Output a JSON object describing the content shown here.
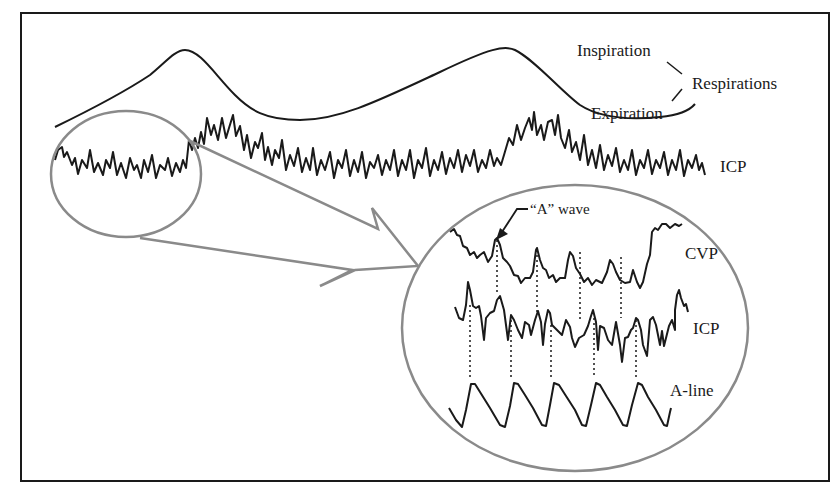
{
  "figure": {
    "header_cut_text": "",
    "colors": {
      "trace": "#1a1a1a",
      "magnifier": "#8a8a8a",
      "frame": "#1a1a1a",
      "background": "#ffffff"
    }
  },
  "labels": {
    "inspiration": "Inspiration",
    "expiration": "Expiration",
    "respirations": "Respirations",
    "icp_main": "ICP",
    "a_wave": "“A” wave",
    "cvp": "CVP",
    "icp_zoom": "ICP",
    "a_line": "A-line"
  },
  "traces": {
    "respiration": "Respiration waveform (two inspiration peaks)",
    "icp_main": "ICP waveform with respiratory variation",
    "cvp": "CVP waveform",
    "icp_zoom": "ICP waveform (magnified)",
    "a_line": "Arterial line waveform"
  }
}
